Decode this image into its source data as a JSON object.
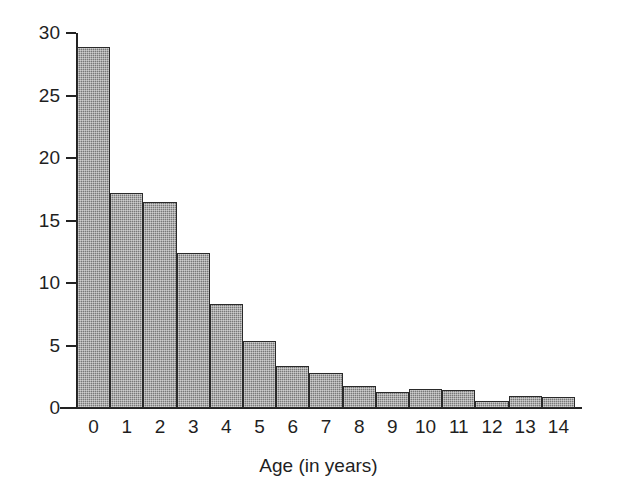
{
  "chart_data": {
    "type": "bar",
    "title": "",
    "xlabel": "Age (in years)",
    "ylabel": "Rate per million per year",
    "categories": [
      "0",
      "1",
      "2",
      "3",
      "4",
      "5",
      "6",
      "7",
      "8",
      "9",
      "10",
      "11",
      "12",
      "13",
      "14"
    ],
    "values": [
      28.9,
      17.2,
      16.5,
      12.4,
      8.3,
      5.4,
      3.4,
      2.8,
      1.8,
      1.25,
      1.55,
      1.45,
      0.6,
      0.95,
      0.9
    ],
    "ylim": [
      0,
      30
    ],
    "xlim": [
      0,
      15
    ],
    "yticks": [
      0,
      5,
      10,
      15,
      20,
      25,
      30
    ],
    "ytick_labels": [
      "0",
      "5",
      "10",
      "15",
      "20",
      "25",
      "30"
    ],
    "xtick_labels": [
      "0",
      "1",
      "2",
      "3",
      "4",
      "5",
      "6",
      "7",
      "8",
      "9",
      "10",
      "11",
      "12",
      "13",
      "14"
    ],
    "grid": false,
    "legend": null,
    "bar_style": {
      "fill_color": "#787878",
      "edge_color": "#2a2a2a",
      "pattern": "stippled-hatch",
      "gap": 0
    },
    "axis_color": "#222222",
    "background": "#ffffff"
  }
}
